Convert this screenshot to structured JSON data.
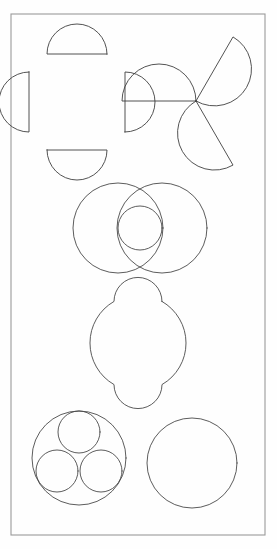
{
  "page": {
    "background_color": "#fefefe",
    "ink_color": "#3a3a3a",
    "frame_color": "#9a9a9a",
    "width": 277,
    "height": 549
  },
  "frame": {
    "name": "outer-border",
    "x": 11,
    "y": 14,
    "width": 254,
    "height": 521,
    "stroke_width": 1.1,
    "color": "#9a9a9a"
  },
  "figures": [
    {
      "id": "fig-1",
      "name": "four-semicircle-cross",
      "label": "Cross of four semicircles",
      "description": "Four half-discs with flat chords outward forming a Maltese-like cross",
      "center": {
        "x": 77,
        "y": 102
      },
      "semicircle_radius": 30,
      "offset": 18,
      "count": 4,
      "stroke_width": 0.9,
      "color": "#3f3f3f"
    },
    {
      "id": "fig-2",
      "name": "three-semicircle-pinwheel",
      "label": "Pinwheel of three semicircles",
      "description": "Three half-discs rotated 120 degrees about a common hub",
      "center": {
        "x": 196,
        "y": 101
      },
      "semicircle_radius": 37,
      "count": 3,
      "rotation_step_deg": 120,
      "start_angle_deg": -60,
      "stroke_width": 0.9,
      "color": "#3f3f3f"
    },
    {
      "id": "fig-3",
      "name": "two-overlapping-circles-with-inner-circle",
      "label": "Vesica with inscribed circle",
      "description": "Two equal overlapping circles plus one small circle centred in the lens",
      "circles": [
        {
          "name": "left-large-circle",
          "cx": 118,
          "cy": 228,
          "r": 45
        },
        {
          "name": "right-large-circle",
          "cx": 162,
          "cy": 228,
          "r": 45
        },
        {
          "name": "inner-small-circle",
          "cx": 140,
          "cy": 228,
          "r": 22
        }
      ],
      "stroke_width": 0.9,
      "color": "#4a4a4a"
    },
    {
      "id": "fig-4",
      "name": "circle-with-two-notches",
      "label": "Circle with top and bottom semicircular bites",
      "description": "A disc outline with concave semicircular notches removed from top and bottom",
      "center": {
        "x": 138,
        "y": 343
      },
      "outer_radius": 48,
      "notch_radius": 24,
      "notch_count": 2,
      "stroke_width": 0.9,
      "color": "#4a4a4a"
    },
    {
      "id": "fig-5",
      "name": "three-circles-in-circle",
      "label": "Three equal circles packed in a circle",
      "description": "Outer circle containing three mutually tangent inner circles",
      "outer": {
        "name": "outer-circle",
        "cx": 79,
        "cy": 458,
        "r": 47
      },
      "inner": [
        {
          "name": "inner-circle-top",
          "cx": 79,
          "cy": 432,
          "r": 21
        },
        {
          "name": "inner-circle-bottom-left",
          "cx": 57,
          "cy": 471,
          "r": 21
        },
        {
          "name": "inner-circle-bottom-right",
          "cx": 101,
          "cy": 471,
          "r": 21
        }
      ],
      "stroke_width": 0.9,
      "color": "#4a4a4a"
    },
    {
      "id": "fig-6",
      "name": "plain-circle",
      "label": "Plain circle",
      "description": "A single empty circle outline",
      "circle": {
        "cx": 192,
        "cy": 463,
        "r": 45
      },
      "stroke_width": 0.9,
      "color": "#4a4a4a"
    }
  ],
  "chart_data": {
    "type": "table",
    "columns": [
      "row",
      "column",
      "figure",
      "component count"
    ],
    "rows": [
      [
        1,
        "left",
        "Cross of four semicircles",
        4
      ],
      [
        1,
        "right",
        "Pinwheel of three semicircles",
        3
      ],
      [
        2,
        "center",
        "Two overlapping circles with inner circle",
        3
      ],
      [
        3,
        "center",
        "Circle with two semicircular notches",
        1
      ],
      [
        4,
        "left",
        "Three circles inscribed in a circle",
        4
      ],
      [
        4,
        "right",
        "Plain circle",
        1
      ]
    ]
  }
}
